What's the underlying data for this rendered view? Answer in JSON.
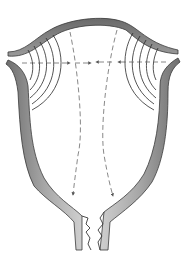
{
  "diagram": {
    "colors": {
      "background": "#ffffff",
      "wall_fill": "#8e8e8e",
      "wall_fill_light": "#c8c8c8",
      "wall_outline": "#3a3a3a",
      "arc_stroke": "#2a2a2a",
      "arrow_stroke": "#555555"
    },
    "elements": {
      "wall": "uterine-wall",
      "left_arcs": 5,
      "right_arcs": 5,
      "horizontal_arrows": "dashed arrows from both cornua toward midline",
      "vertical_arrows": "two dashed arrows curving down toward cervical opening",
      "cervix": "jagged cervical opening at bottom"
    },
    "labels": []
  }
}
